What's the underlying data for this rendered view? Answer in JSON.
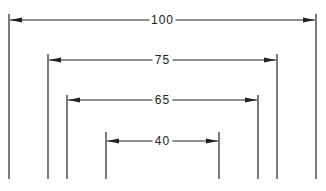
{
  "diagram": {
    "type": "nested-dimension-lines",
    "color": "#222222",
    "background": "#ffffff",
    "dimensions": [
      {
        "label": "100",
        "left_x": 9,
        "right_x": 316,
        "arrow_y": 20,
        "top_y": 14,
        "bottom_y": 179
      },
      {
        "label": "75",
        "left_x": 48,
        "right_x": 277,
        "arrow_y": 60,
        "top_y": 54,
        "bottom_y": 179
      },
      {
        "label": "65",
        "left_x": 67,
        "right_x": 258,
        "arrow_y": 100,
        "top_y": 95,
        "bottom_y": 179
      },
      {
        "label": "40",
        "left_x": 106,
        "right_x": 219,
        "arrow_y": 141,
        "top_y": 132,
        "bottom_y": 179
      }
    ]
  }
}
